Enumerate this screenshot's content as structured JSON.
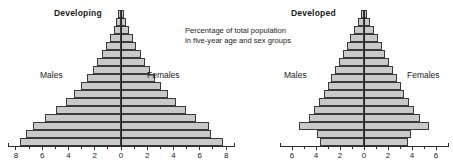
{
  "caption": {
    "line1": "Percentage of total population",
    "line2": "in five-year age and sex groups"
  },
  "labels": {
    "males": "Males",
    "females": "Females"
  },
  "panels": {
    "developing": {
      "title": "Developing"
    },
    "developed": {
      "title": "Developed"
    }
  },
  "chart_data": [
    {
      "type": "bar",
      "orientation": "population-pyramid",
      "title": "Developing",
      "xlabel": "Percentage of total population",
      "ylabel": "Five-year age groups",
      "xlim": [
        -8.6,
        8.6
      ],
      "grid": false,
      "legend": [
        "Males",
        "Females"
      ],
      "legend_position": "inside-left-and-right",
      "axis_ticks_major": [
        8,
        6,
        4,
        2,
        0,
        2,
        4,
        6,
        8
      ],
      "axis_ticks_minor_step": 1,
      "categories": [
        "80+",
        "75-79",
        "70-74",
        "65-69",
        "60-64",
        "55-59",
        "50-54",
        "45-49",
        "40-44",
        "35-39",
        "30-34",
        "25-29",
        "20-24",
        "15-19",
        "10-14",
        "5-9",
        "0-4"
      ],
      "series": [
        {
          "name": "Males",
          "side": "left",
          "values": [
            0.22,
            0.4,
            0.62,
            0.92,
            1.25,
            1.6,
            1.95,
            2.35,
            2.8,
            3.3,
            3.85,
            4.55,
            5.35,
            6.25,
            7.3,
            7.85,
            8.35
          ]
        },
        {
          "name": "Females",
          "side": "right",
          "values": [
            0.26,
            0.44,
            0.66,
            0.96,
            1.28,
            1.62,
            1.98,
            2.38,
            2.82,
            3.32,
            3.88,
            4.58,
            5.35,
            6.2,
            7.25,
            7.45,
            8.4
          ]
        }
      ]
    },
    {
      "type": "bar",
      "orientation": "population-pyramid",
      "title": "Developed",
      "xlabel": "Percentage of total population",
      "ylabel": "Five-year age groups",
      "xlim": [
        -7.0,
        7.0
      ],
      "grid": false,
      "legend": [
        "Males",
        "Females"
      ],
      "legend_position": "inside-left-and-right",
      "axis_ticks_major": [
        6,
        4,
        2,
        0,
        2,
        4,
        6
      ],
      "axis_ticks_minor_step": 1,
      "categories": [
        "80+",
        "75-79",
        "70-74",
        "65-69",
        "60-64",
        "55-59",
        "50-54",
        "45-49",
        "40-44",
        "35-39",
        "30-34",
        "25-29",
        "20-24",
        "15-19",
        "10-14",
        "5-9",
        "0-4"
      ],
      "series": [
        {
          "name": "Males",
          "side": "left",
          "values": [
            0.3,
            0.55,
            0.9,
            1.25,
            1.6,
            1.95,
            2.3,
            2.65,
            3.0,
            3.35,
            3.7,
            4.15,
            4.6,
            5.1,
            5.95,
            4.3,
            4.05
          ]
        },
        {
          "name": "Females",
          "side": "right",
          "values": [
            0.32,
            0.58,
            0.94,
            1.28,
            1.62,
            1.98,
            2.32,
            2.68,
            3.02,
            3.38,
            3.72,
            4.18,
            4.62,
            5.15,
            6.0,
            4.32,
            4.05
          ]
        }
      ]
    }
  ]
}
